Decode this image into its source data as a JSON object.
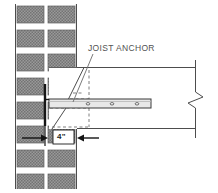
{
  "drawing": {
    "title": "Joist Anchor Masonry Bearing Detail",
    "type": "architectural-section-detail",
    "width": 218,
    "height": 193,
    "background": "#ffffff",
    "line_color": "#4d4d4d",
    "dark_line_color": "#1a1a1a",
    "block_fill": "#8f8f8f",
    "block_stroke": "#5c5c5c",
    "mortar_color": "#ffffff",
    "hidden_line_color": "#6e6e6e",
    "cut_fill": "#ffffff"
  },
  "annotations": {
    "anchor_label": "JOIST ANCHOR",
    "dimension_label": "4\"",
    "dimension_meaning": "minimum joist bearing on masonry wall"
  },
  "wall": {
    "name": "masonry-block-wall",
    "left": 15,
    "right": 77,
    "top": 4,
    "bottom": 189,
    "columns": 2,
    "course_height": 24,
    "courses": 8
  },
  "joist": {
    "name": "wood-floor-joist",
    "top_y": 67,
    "bottom_y": 129,
    "right_x": 195,
    "bearing_left_x": 49
  },
  "anchor": {
    "name": "steel-joist-anchor-strap",
    "strap_top": 99,
    "strap_bottom": 108,
    "strap_left": 49,
    "strap_right": 151,
    "hole_count": 3,
    "hole_positions": [
      88,
      112,
      137
    ],
    "leg_x": 45,
    "leg_top": 84,
    "leg_bottom": 126
  },
  "break_symbol": {
    "name": "break-line",
    "x": 195,
    "top_y": 60,
    "bottom_y": 138,
    "style": "z-squiggle"
  },
  "firecut": {
    "name": "fire-cut-bevel",
    "description": "angled bevel cut at joist end bearing in wall"
  },
  "dimension": {
    "name": "bearing-dimension",
    "value": "4\"",
    "left_arrow_from": 22,
    "left_arrow_to": 46,
    "right_arrow_from": 97,
    "right_arrow_to": 77,
    "y": 138
  },
  "icons": {
    "break_line": "break-line-icon",
    "arrow_right": "arrow-right-icon",
    "arrow_left": "arrow-left-icon"
  }
}
